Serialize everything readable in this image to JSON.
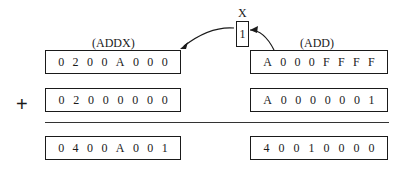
{
  "x_flag": {
    "label": "X",
    "value": "1"
  },
  "left": {
    "label": "(ADDX)",
    "operand1": "0200A000",
    "operand2": "02000000",
    "result": "0400A001"
  },
  "right": {
    "label": "(ADD)",
    "operand1": "A000FFFF",
    "operand2": "A0000001",
    "result": "40010000"
  },
  "operator": "+"
}
